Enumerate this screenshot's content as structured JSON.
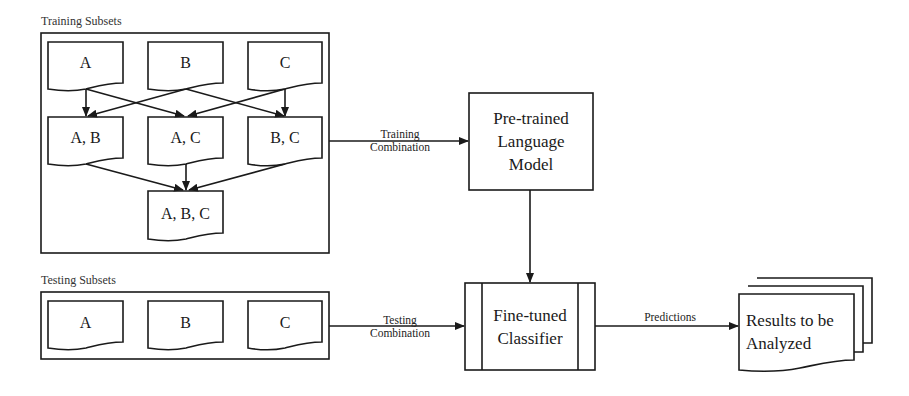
{
  "training": {
    "title": "Training Subsets",
    "singles": [
      "A",
      "B",
      "C"
    ],
    "pairs": [
      "A, B",
      "A, C",
      "B, C"
    ],
    "triple": "A, B, C"
  },
  "testing": {
    "title": "Testing Subsets",
    "singles": [
      "A",
      "B",
      "C"
    ]
  },
  "edges": {
    "training_combination": [
      "Training",
      "Combination"
    ],
    "testing_combination": [
      "Testing",
      "Combination"
    ],
    "predictions": "Predictions"
  },
  "plm": {
    "lines": [
      "Pre-trained",
      "Language",
      "Model"
    ]
  },
  "classifier": {
    "lines": [
      "Fine-tuned",
      "Classifier"
    ]
  },
  "results": {
    "lines": [
      "Results to be",
      "Analyzed"
    ]
  },
  "colors": {
    "stroke": "#1a1a1a",
    "background": "#ffffff"
  }
}
